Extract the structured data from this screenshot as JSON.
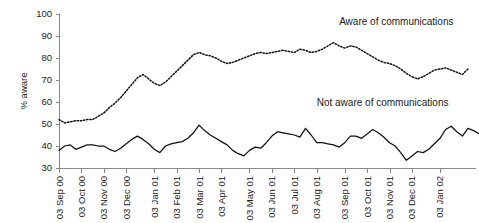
{
  "chart_data": {
    "type": "line",
    "title": "",
    "xlabel": "",
    "ylabel": "% aware",
    "ylim": [
      30,
      100
    ],
    "ytick_values": [
      30,
      40,
      50,
      60,
      70,
      80,
      90,
      100
    ],
    "ytick_labels": [
      "30",
      "40",
      "50",
      "60",
      "70",
      "80",
      "90",
      "100"
    ],
    "grid": false,
    "legend_position": "inline-annotations",
    "xtick_labels": [
      "03 Sep 00",
      "03 Oct 00",
      "03 Nov 00",
      "03 Dec 00",
      "03 Jan 01",
      "03 Feb 01",
      "03 Mar 01",
      "03 Apr 01",
      "03 May 01",
      "03 Jun 01",
      "03 Jul 01",
      "03 Aug 01",
      "03 Sep 01",
      "03 Oct 01",
      "03 Nov 01",
      "03 Dec 01",
      "03 Jan 02"
    ],
    "xtick_positions": [
      0,
      4,
      8,
      12,
      17,
      21,
      25,
      29,
      34,
      38,
      42,
      46,
      51,
      55,
      59,
      63,
      68
    ],
    "n_points": 74,
    "annotations": [
      {
        "text": "Aware of communications",
        "x_point": 50,
        "y_value": 95
      },
      {
        "text": "Not aware of communications",
        "x_point": 46,
        "y_value": 58
      }
    ],
    "series": [
      {
        "name": "Aware of communications",
        "style": "dotted",
        "color": "#111111",
        "values": [
          52,
          50.5,
          51,
          51.5,
          51.5,
          52,
          52,
          53.5,
          55,
          57.5,
          59.5,
          62,
          65,
          68,
          71,
          72.5,
          70.5,
          68.5,
          67.5,
          69,
          71.5,
          74,
          76.5,
          79,
          81.5,
          82.5,
          81.5,
          81,
          80,
          78.5,
          77.5,
          78,
          79,
          80,
          81,
          82,
          82.5,
          82,
          82.5,
          83,
          83.5,
          83,
          82.5,
          84,
          83.5,
          82.5,
          83,
          84,
          85.5,
          87,
          85.5,
          84.5,
          85.5,
          85,
          83.5,
          82,
          80.5,
          79,
          78,
          77.5,
          76.5,
          75,
          73,
          71.5,
          70.5,
          71.5,
          73,
          74.5,
          75,
          75.5,
          74.5,
          73.5,
          72.5,
          75
        ]
      },
      {
        "name": "Not aware of communications",
        "style": "solid",
        "color": "#111111",
        "values": [
          38,
          40,
          40.5,
          38.5,
          39.5,
          40.5,
          40.5,
          40,
          40,
          38.5,
          37.5,
          39,
          41,
          43,
          44.5,
          43,
          41,
          38.5,
          37,
          40,
          41,
          41.5,
          42,
          43.5,
          46,
          49.5,
          47,
          45,
          43.5,
          42,
          40.5,
          38,
          36.5,
          35.5,
          38,
          39.5,
          39,
          41.5,
          44.5,
          46.5,
          46,
          45.5,
          45,
          44,
          48,
          45,
          41.5,
          41.5,
          41,
          40.5,
          39.5,
          41.5,
          44.5,
          44.5,
          43.5,
          45.5,
          47.5,
          46,
          44,
          41.5,
          40,
          37,
          33.5,
          35.5,
          37.5,
          37,
          38.5,
          41,
          43.5,
          47.5,
          49,
          46.5,
          44.5,
          48,
          47,
          45.5
        ]
      }
    ]
  },
  "plot_geometry": {
    "left": 59,
    "right": 468,
    "top": 14,
    "bottom": 168
  }
}
